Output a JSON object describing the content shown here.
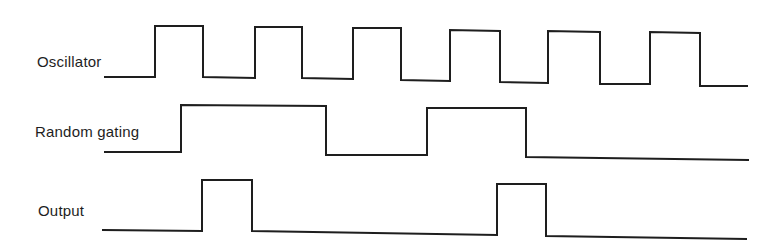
{
  "diagram": {
    "type": "timing-diagram",
    "stroke_color": "#1e1e1e",
    "background_color": "#ffffff",
    "signals": [
      {
        "label": "Oscillator",
        "description": "square wave, 6 pulses",
        "points": "105,77 155,77 155,26 203,26 203,77 255,78 255,27 302,27 302,78 353,79 353,28 401,28 401,80 450,81 450,30 500,31 500,82 548,83 548,31 600,32 600,84 650,84 650,32 700,33 700,86 747,86"
      },
      {
        "label": "Random gating",
        "description": "two gate pulses",
        "points": "105,152 181,152 181,105 326,106 326,155 427,155 427,108 526,108 526,157 748,160"
      },
      {
        "label": "Output",
        "description": "single oscillator pulse passed during each gate-open transition",
        "points": "103,230 202,231 202,180 252,180 252,231 497,235 497,184 546,184 546,236 746,239"
      }
    ]
  }
}
